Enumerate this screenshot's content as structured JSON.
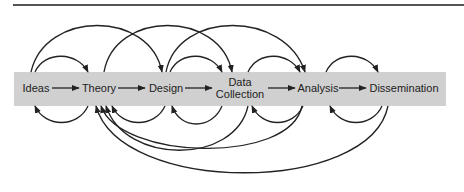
{
  "diagram": {
    "title": "",
    "nodes": [
      {
        "id": "ideas",
        "label_line1": "Ideas",
        "label_line2": ""
      },
      {
        "id": "theory",
        "label_line1": "Theory",
        "label_line2": ""
      },
      {
        "id": "design",
        "label_line1": "Design",
        "label_line2": ""
      },
      {
        "id": "data-collection",
        "label_line1": "Data",
        "label_line2": "Collection"
      },
      {
        "id": "analysis",
        "label_line1": "Analysis",
        "label_line2": ""
      },
      {
        "id": "dissemination",
        "label_line1": "Dissemination",
        "label_line2": ""
      }
    ],
    "forward_edges": [
      [
        "Ideas",
        "Theory"
      ],
      [
        "Theory",
        "Design"
      ],
      [
        "Design",
        "Data Collection"
      ],
      [
        "Data Collection",
        "Analysis"
      ],
      [
        "Analysis",
        "Dissemination"
      ]
    ],
    "upper_arcs": [
      [
        "Ideas",
        "Theory"
      ],
      [
        "Ideas",
        "Design"
      ],
      [
        "Theory",
        "Data Collection"
      ],
      [
        "Design",
        "Data Collection"
      ],
      [
        "Design",
        "Analysis"
      ],
      [
        "Data Collection",
        "Analysis"
      ],
      [
        "Analysis",
        "Dissemination"
      ]
    ],
    "lower_arcs": [
      [
        "Theory",
        "Ideas"
      ],
      [
        "Design",
        "Theory"
      ],
      [
        "Data Collection",
        "Theory"
      ],
      [
        "Analysis",
        "Theory"
      ],
      [
        "Dissemination",
        "Theory"
      ],
      [
        "Data Collection",
        "Design"
      ],
      [
        "Analysis",
        "Data Collection"
      ],
      [
        "Dissemination",
        "Analysis"
      ]
    ],
    "colors": {
      "band": "#d0d0d0",
      "line": "#222222",
      "rule": "#555555"
    }
  }
}
